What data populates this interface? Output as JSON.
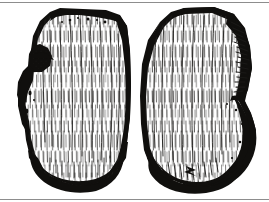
{
  "plate": {
    "title": "Two-view ink illustration of a chipped stone artifact",
    "medium": "pen-and-ink line drawing, vertical hatching",
    "background_color": "#ffffff",
    "ink_color": "#100f0d",
    "frame_rule_color": "#8d8d8d",
    "width_px": 269,
    "height_px": 202,
    "frame": {
      "top_rule_y": 2,
      "bottom_rule_y": 199,
      "visible": true
    },
    "figures": [
      {
        "id": "figure-left",
        "view_label": "obverse face",
        "outline_note": "roughly rectangular cobble with flat dark top edge, deep notch on upper-left margin, rounded lobe lower-left, concave black basal edge",
        "bounds": {
          "x": 18,
          "y": 8,
          "width": 112,
          "height": 182
        },
        "fill": "#ffffff",
        "outline_ink": "#100f0d",
        "features": [
          "flat dark top platform band",
          "stippled notch with flake scar on left margin",
          "rounded bulb at lower left",
          "heavy black concave base",
          "dense vertical interior hatching"
        ]
      },
      {
        "id": "figure-right",
        "view_label": "reverse face",
        "outline_note": "mirrored cobble with heavy black shaded right margin bearing ladder hatch marks, rounded lobe on lower right, black concave base",
        "bounds": {
          "x": 140,
          "y": 8,
          "width": 118,
          "height": 182
        },
        "fill": "#ffffff",
        "outline_ink": "#100f0d",
        "features": [
          "dark cortex band along upper right margin",
          "ladder-style hatch marks within dark margin",
          "rounded lobe at lower right outlined in solid black",
          "heavy black concave base",
          "dense vertical interior hatching"
        ]
      }
    ]
  }
}
